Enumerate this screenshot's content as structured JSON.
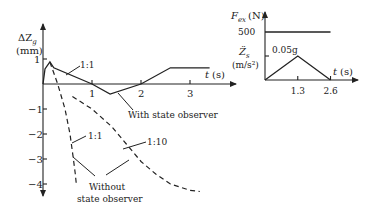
{
  "chart_data": [
    {
      "type": "line",
      "title": "",
      "ylabel": "ΔZ_g (mm)",
      "ylabel_main": "ΔZ",
      "ylabel_sub": "g",
      "ylabel_unit": "(mm)",
      "xlabel": "t (s)",
      "xlabel_var": "t",
      "xlabel_unit": "(s)",
      "xlim": [
        0,
        3.9
      ],
      "ylim": [
        -4.2,
        1.3
      ],
      "xticks": [
        1,
        2,
        3
      ],
      "yticks": [
        1,
        -1,
        -2,
        -3,
        -4
      ],
      "grid": false,
      "series": [
        {
          "name": "With state observer (1:1)",
          "style": "solid",
          "x": [
            0,
            0.04,
            0.14,
            0.22,
            1.0,
            1.37,
            2.0,
            2.6,
            3.4
          ],
          "y": [
            0,
            0.6,
            0.88,
            0.65,
            0.0,
            -0.4,
            0.0,
            0.65,
            0.65
          ]
        },
        {
          "name": "Without state observer 1:1",
          "style": "dashed",
          "x": [
            0.14,
            0.3,
            0.45,
            0.55,
            0.62,
            0.66,
            0.68
          ],
          "y": [
            0.88,
            0.0,
            -1.0,
            -2.0,
            -3.0,
            -3.6,
            -4.0
          ]
        },
        {
          "name": "Without state observer 1:10",
          "style": "dashed",
          "x": [
            0.6,
            1.0,
            1.4,
            1.7,
            2.0,
            2.3,
            2.6,
            3.0,
            3.2
          ],
          "y": [
            -0.5,
            -1.0,
            -1.7,
            -2.4,
            -3.1,
            -3.6,
            -4.0,
            -4.25,
            -4.3
          ]
        }
      ],
      "annotations": [
        {
          "text": "1:1",
          "target": "With state observer (1:1)"
        },
        {
          "text": "With state observer",
          "target": "With state observer (1:1)"
        },
        {
          "text": "1:1",
          "target": "Without state observer 1:1"
        },
        {
          "text": "1:10",
          "target": "Without state observer 1:10"
        },
        {
          "text": "Without",
          "target": "without-group"
        },
        {
          "text": "state observer",
          "target": "without-group"
        }
      ]
    },
    {
      "type": "line",
      "title": "",
      "ylabel_top": "F_ex (N)",
      "ylabel_top_main": "F",
      "ylabel_top_sub": "ex",
      "ylabel_top_unit": "(N)",
      "ylabel_bottom_main": "Z̈",
      "ylabel_bottom_sub": "s",
      "ylabel_bottom_unit": "(m/s²)",
      "xlabel": "t (s)",
      "xlabel_var": "t",
      "xlabel_unit": "(s)",
      "xticks": [
        1.3,
        2.6
      ],
      "xtick_labels": [
        "1.3",
        "2.6"
      ],
      "xlim": [
        0,
        3.4
      ],
      "series": [
        {
          "name": "F_ex",
          "style": "solid",
          "x": [
            0,
            2.6
          ],
          "y": [
            500,
            500
          ],
          "label": "500"
        },
        {
          "name": "Z_s acceleration",
          "style": "solid",
          "x": [
            0,
            1.3,
            2.6
          ],
          "y": [
            0,
            0.05,
            0
          ],
          "unit": "g",
          "label": "0.05g"
        }
      ]
    }
  ]
}
